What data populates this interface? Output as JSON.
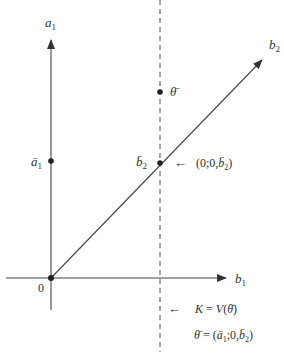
{
  "diagram": {
    "axes": {
      "vertical": {
        "label": "a",
        "subscript": "1"
      },
      "horizontal": {
        "label": "b",
        "subscript": "1"
      },
      "diagonal": {
        "label": "b",
        "subscript": "2"
      },
      "origin_label": "0"
    },
    "points": {
      "a1_bar": {
        "label": "ā",
        "subscript": "1"
      },
      "b2_bar": {
        "label": "b̄",
        "subscript": "2"
      },
      "theta_bar": {
        "label": "θ̄"
      }
    },
    "annotations": {
      "b2_point_arrow": "←",
      "b2_point_coords_prefix": "(0;0,",
      "b2_point_coords_var": "b̄",
      "b2_point_coords_sub": "2",
      "b2_point_coords_suffix": ")",
      "K_arrow": "←",
      "K_text_left": "K",
      "K_text_eq": " = ",
      "K_text_V": "V",
      "K_text_paren_open": "(",
      "K_text_theta": "θ̄",
      "K_text_paren_close": ")",
      "theta_def_lhs": "θ̄",
      "theta_def_eq": " = (",
      "theta_def_a": "ā",
      "theta_def_a_sub": "1",
      "theta_def_mid": ";0,",
      "theta_def_b": "b̄",
      "theta_def_b_sub": "2",
      "theta_def_close": ")"
    },
    "colors": {
      "line": "#444444",
      "point": "#222222",
      "text": "#333333"
    }
  }
}
